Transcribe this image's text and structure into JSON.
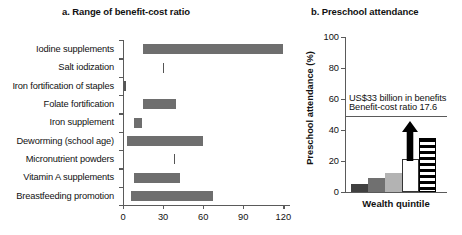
{
  "panel_a": {
    "title": "a. Range of benefit-cost ratio",
    "axis": {
      "xticks": [
        0,
        30,
        60,
        90,
        120
      ],
      "xlim": [
        0,
        125
      ]
    }
  },
  "panel_b": {
    "title": "b. Preschool attendance",
    "ylabel": "Preschool attendance (%)",
    "xlabel": "Wealth quintile",
    "yticks": [
      0,
      20,
      40,
      60,
      80,
      100
    ],
    "annotation_line1": "US$33 billion in benefits",
    "annotation_line2": "Benefit-cost ratio 17.6"
  },
  "chart_data": [
    {
      "type": "bar",
      "orientation": "horizontal",
      "title": "a. Range of benefit-cost ratio",
      "xlabel": "",
      "ylabel": "",
      "xlim": [
        0,
        125
      ],
      "xticks": [
        0,
        30,
        60,
        90,
        120
      ],
      "grid": false,
      "note": "Floating range bars: each bar spans from low to high benefit-cost ratio",
      "categories": [
        "Iodine supplements",
        "Salt iodization",
        "Iron fortification of staples",
        "Folate fortification",
        "Iron supplement",
        "Deworming (school age)",
        "Micronutrient powders",
        "Vitamin A supplements",
        "Breastfeeding promotion"
      ],
      "ranges": [
        {
          "category": "Iodine supplements",
          "low": 15,
          "high": 120
        },
        {
          "category": "Salt iodization",
          "low": 30,
          "high": 30
        },
        {
          "category": "Iron fortification of staples",
          "low": 1,
          "high": 1
        },
        {
          "category": "Folate fortification",
          "low": 15,
          "high": 40
        },
        {
          "category": "Iron supplement",
          "low": 8,
          "high": 14
        },
        {
          "category": "Deworming (school age)",
          "low": 3,
          "high": 60
        },
        {
          "category": "Micronutrient powders",
          "low": 38,
          "high": 38
        },
        {
          "category": "Vitamin A supplements",
          "low": 8,
          "high": 43
        },
        {
          "category": "Breastfeeding promotion",
          "low": 6,
          "high": 67
        }
      ]
    },
    {
      "type": "bar",
      "orientation": "vertical",
      "title": "b. Preschool attendance",
      "xlabel": "Wealth quintile",
      "ylabel": "Preschool attendance (%)",
      "ylim": [
        0,
        100
      ],
      "yticks": [
        0,
        20,
        40,
        60,
        80,
        100
      ],
      "grid": false,
      "categories": [
        "1",
        "2",
        "3",
        "4",
        "5"
      ],
      "values": [
        5,
        9,
        12,
        21,
        35
      ],
      "bar_styles": [
        "dark-gray",
        "medium-gray",
        "light-gray",
        "white-outline",
        "black-striped"
      ],
      "annotations": [
        {
          "text": "US$33 billion in benefits",
          "y": 60
        },
        {
          "text": "Benefit-cost ratio 17.6",
          "y": 54
        },
        {
          "type": "hline",
          "y": 49
        },
        {
          "type": "arrow",
          "from_y": 20,
          "to_y": 46,
          "x_category": "4"
        }
      ]
    }
  ],
  "colors": {
    "bar_gray": "#6e6e6e",
    "axis": "#5a5a5a",
    "text": "#111111",
    "b_bar1": "#404040",
    "b_bar2": "#707070",
    "b_bar3": "#b3b3b3",
    "b_bar4": "#ffffff",
    "b_bar5": "#000000"
  }
}
